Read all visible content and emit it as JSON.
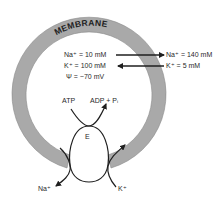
{
  "diagram": {
    "title": "MEMBRANE",
    "inside": {
      "na": "Na⁺ = 10 mM",
      "k": "K⁺ = 100 mM",
      "psi": "Ψ = −70 mV"
    },
    "outside": {
      "na": "Na⁺ = 140 mM",
      "k": "K⁺ = 5 mM"
    },
    "enzyme": {
      "label": "E",
      "substrate": "ATP",
      "product": "ADP + Pᵢ"
    },
    "ions": {
      "na_out": "Na⁺",
      "k_in": "K⁺"
    },
    "colors": {
      "membrane_fill": "#a9a9a9",
      "stroke": "#1f1f1f",
      "text": "#2a2a2a"
    }
  }
}
